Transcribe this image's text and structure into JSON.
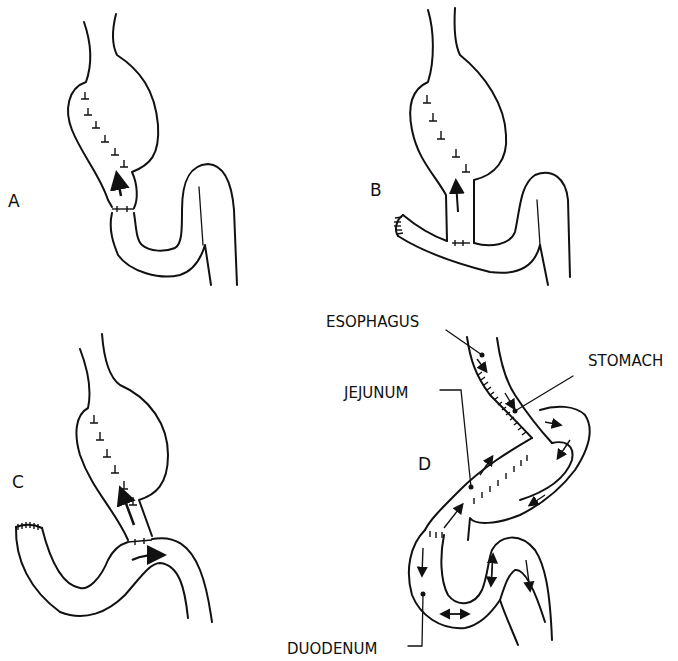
{
  "panels": [
    {
      "id": "A",
      "label": "A"
    },
    {
      "id": "B",
      "label": "B"
    },
    {
      "id": "C",
      "label": "C"
    },
    {
      "id": "D",
      "label": "D"
    }
  ],
  "anatomy_labels": {
    "esophagus": "ESOPHAGUS",
    "stomach": "STOMACH",
    "jejunum": "JEJUNUM",
    "duodenum": "DUODENUM"
  },
  "colors": {
    "line": "#111111",
    "background": "#ffffff"
  }
}
